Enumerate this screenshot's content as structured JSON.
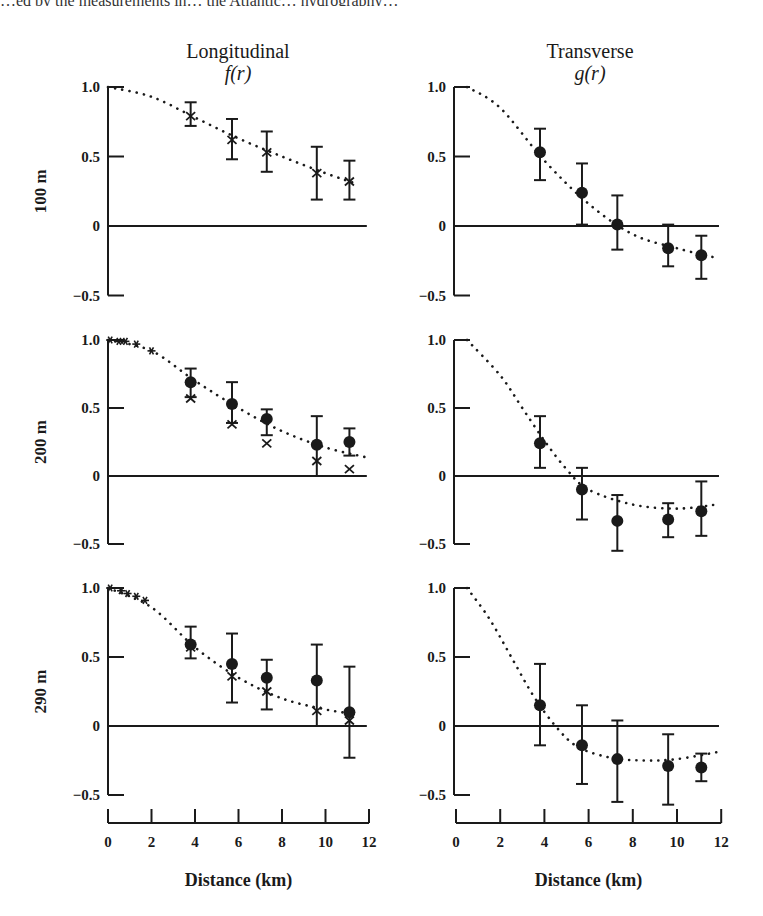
{
  "page": {
    "top_fragment": "…ed by the measurements in… the Atlantic… hydrography…",
    "columns": [
      {
        "title": "Longitudinal",
        "function": "f(r)"
      },
      {
        "title": "Transverse",
        "function": "g(r)"
      }
    ],
    "rows": [
      "100 m",
      "200 m",
      "290 m"
    ],
    "xlabel": "Distance (km)",
    "xticks": [
      "0",
      "2",
      "4",
      "6",
      "8",
      "10",
      "12"
    ],
    "yticks": [
      "1.0",
      "0.5",
      "0",
      "-0.5"
    ]
  },
  "chart_data": [
    {
      "type": "scatter",
      "panel": "Longitudinal f(r), 100 m",
      "xlabel": "Distance (km)",
      "ylabel": "100 m",
      "xlim": [
        0,
        12
      ],
      "ylim": [
        -0.5,
        1.0
      ],
      "series": [
        {
          "name": "crosses",
          "marker": "x",
          "x": [
            3.8,
            5.7,
            7.3,
            9.6,
            11.1
          ],
          "y": [
            0.79,
            0.62,
            0.53,
            0.38,
            0.32
          ],
          "err_low": [
            0.72,
            0.48,
            0.39,
            0.19,
            0.19
          ],
          "err_high": [
            0.89,
            0.77,
            0.68,
            0.57,
            0.47
          ]
        },
        {
          "name": "fit",
          "style": "dotted",
          "x": [
            0,
            2,
            4,
            6,
            8,
            10,
            11.5
          ],
          "y": [
            1.0,
            0.93,
            0.78,
            0.63,
            0.5,
            0.38,
            0.3
          ]
        }
      ]
    },
    {
      "type": "scatter",
      "panel": "Transverse g(r), 100 m",
      "xlabel": "Distance (km)",
      "ylabel": "100 m",
      "xlim": [
        0,
        12
      ],
      "ylim": [
        -0.5,
        1.0
      ],
      "series": [
        {
          "name": "dots",
          "marker": "o",
          "x": [
            3.8,
            5.7,
            7.3,
            9.6,
            11.1
          ],
          "y": [
            0.53,
            0.24,
            0.01,
            -0.16,
            -0.21
          ],
          "err_low": [
            0.33,
            0.01,
            -0.17,
            -0.29,
            -0.38
          ],
          "err_high": [
            0.7,
            0.45,
            0.22,
            0.01,
            -0.07
          ]
        },
        {
          "name": "fit",
          "style": "dotted",
          "x": [
            0.5,
            2,
            4,
            6,
            8,
            10,
            11.8
          ],
          "y": [
            1.0,
            0.85,
            0.47,
            0.16,
            -0.06,
            -0.16,
            -0.23
          ]
        }
      ]
    },
    {
      "type": "scatter",
      "panel": "Longitudinal f(r), 200 m",
      "xlabel": "Distance (km)",
      "ylabel": "200 m",
      "xlim": [
        0,
        12
      ],
      "ylim": [
        -0.5,
        1.0
      ],
      "series": [
        {
          "name": "dots",
          "marker": "o",
          "x": [
            3.8,
            5.7,
            7.3,
            9.6,
            11.1
          ],
          "y": [
            0.69,
            0.53,
            0.42,
            0.23,
            0.25
          ],
          "err_low": [
            0.58,
            0.39,
            0.3,
            0.0,
            0.15
          ],
          "err_high": [
            0.79,
            0.69,
            0.49,
            0.44,
            0.35
          ]
        },
        {
          "name": "crosses",
          "marker": "x",
          "x": [
            3.8,
            5.7,
            7.3,
            9.6,
            11.1
          ],
          "y": [
            0.57,
            0.38,
            0.24,
            0.11,
            0.05
          ]
        },
        {
          "name": "near-origin",
          "marker": "*",
          "x": [
            0.1,
            0.5,
            0.8,
            1.3,
            2.0
          ],
          "y": [
            1.0,
            0.99,
            0.99,
            0.97,
            0.92
          ]
        },
        {
          "name": "fit",
          "style": "dotted",
          "x": [
            0,
            2,
            4,
            6,
            8,
            10,
            11.8
          ],
          "y": [
            1.0,
            0.92,
            0.7,
            0.5,
            0.33,
            0.21,
            0.14
          ]
        }
      ]
    },
    {
      "type": "scatter",
      "panel": "Transverse g(r), 200 m",
      "xlabel": "Distance (km)",
      "ylabel": "200 m",
      "xlim": [
        0,
        12
      ],
      "ylim": [
        -0.5,
        1.0
      ],
      "series": [
        {
          "name": "dots",
          "marker": "o",
          "x": [
            3.8,
            5.7,
            7.3,
            9.6,
            11.1
          ],
          "y": [
            0.24,
            -0.1,
            -0.33,
            -0.32,
            -0.26
          ],
          "err_low": [
            0.06,
            -0.32,
            -0.55,
            -0.45,
            -0.44
          ],
          "err_high": [
            0.44,
            0.06,
            -0.14,
            -0.2,
            -0.04
          ]
        },
        {
          "name": "fit",
          "style": "dotted",
          "x": [
            0.5,
            2,
            3,
            4,
            5,
            6,
            8,
            10,
            11.8
          ],
          "y": [
            1.0,
            0.74,
            0.5,
            0.26,
            0.05,
            -0.1,
            -0.21,
            -0.24,
            -0.21
          ]
        }
      ]
    },
    {
      "type": "scatter",
      "panel": "Longitudinal f(r), 290 m",
      "xlabel": "Distance (km)",
      "ylabel": "290 m",
      "xlim": [
        0,
        12
      ],
      "ylim": [
        -0.5,
        1.0
      ],
      "series": [
        {
          "name": "dots",
          "marker": "o",
          "x": [
            3.8,
            5.7,
            7.3,
            9.6,
            11.1
          ],
          "y": [
            0.59,
            0.45,
            0.35,
            0.33,
            0.1
          ],
          "err_low": [
            0.49,
            0.17,
            0.12,
            0.0,
            -0.23
          ],
          "err_high": [
            0.72,
            0.67,
            0.48,
            0.59,
            0.43
          ]
        },
        {
          "name": "crosses",
          "marker": "x",
          "x": [
            3.8,
            5.7,
            7.3,
            9.6,
            11.1
          ],
          "y": [
            0.57,
            0.36,
            0.25,
            0.11,
            0.04
          ]
        },
        {
          "name": "near-origin",
          "marker": "*",
          "x": [
            0.1,
            0.6,
            0.9,
            1.3,
            1.7
          ],
          "y": [
            1.0,
            0.98,
            0.96,
            0.94,
            0.91
          ]
        },
        {
          "name": "fit",
          "style": "dotted",
          "x": [
            0,
            2,
            4,
            6,
            8,
            10,
            11.2
          ],
          "y": [
            1.0,
            0.86,
            0.57,
            0.35,
            0.2,
            0.12,
            0.09
          ]
        }
      ]
    },
    {
      "type": "scatter",
      "panel": "Transverse g(r), 290 m",
      "xlabel": "Distance (km)",
      "ylabel": "290 m",
      "xlim": [
        0,
        12
      ],
      "ylim": [
        -0.5,
        1.0
      ],
      "series": [
        {
          "name": "dots",
          "marker": "o",
          "x": [
            3.8,
            5.7,
            7.3,
            9.6,
            11.1
          ],
          "y": [
            0.15,
            -0.14,
            -0.24,
            -0.29,
            -0.3
          ],
          "err_low": [
            -0.14,
            -0.42,
            -0.55,
            -0.57,
            -0.4
          ],
          "err_high": [
            0.45,
            0.15,
            0.04,
            -0.06,
            -0.2
          ]
        },
        {
          "name": "fit",
          "style": "dotted",
          "x": [
            0.5,
            1.5,
            2.5,
            3.5,
            4.5,
            5.5,
            7,
            8.5,
            10,
            11.8
          ],
          "y": [
            1.0,
            0.78,
            0.5,
            0.22,
            0.0,
            -0.15,
            -0.23,
            -0.25,
            -0.24,
            -0.19
          ]
        }
      ]
    }
  ]
}
